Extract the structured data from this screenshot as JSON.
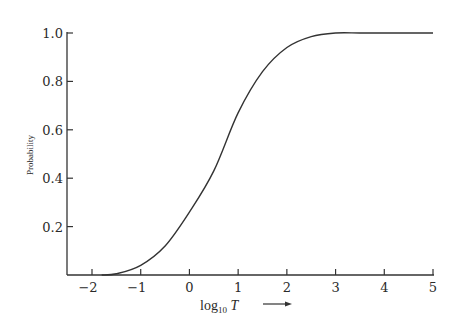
{
  "chart_data": {
    "type": "line",
    "title": "",
    "xlabel": "log10 T →",
    "ylabel": "Probability",
    "xlim": [
      -2.5,
      5
    ],
    "ylim": [
      0,
      1.0
    ],
    "grid": false,
    "legend": null,
    "x_ticks": [
      -2,
      -1,
      0,
      1,
      2,
      3,
      4,
      5
    ],
    "x_tick_labels": [
      "−2",
      "−1",
      "0",
      "1",
      "2",
      "3",
      "4",
      "5"
    ],
    "y_ticks": [
      0.2,
      0.4,
      0.6,
      0.8,
      1.0
    ],
    "y_tick_labels": [
      "0.2",
      "0.4",
      "0.6",
      "0.8",
      "1.0"
    ],
    "series": [
      {
        "name": "cumulative probability",
        "color": "#333333",
        "x": [
          -1.8,
          -1.5,
          -1.0,
          -0.5,
          0.0,
          0.5,
          1.0,
          1.5,
          2.0,
          2.5,
          3.0,
          3.5,
          4.0,
          5.0
        ],
        "y": [
          0.0,
          0.005,
          0.04,
          0.12,
          0.26,
          0.43,
          0.67,
          0.84,
          0.94,
          0.985,
          1.0,
          1.0,
          1.0,
          1.0
        ]
      }
    ]
  },
  "labels": {
    "ylabel": "Probability",
    "xlabel_prefix": "log",
    "xlabel_sub": "10",
    "xlabel_var": " T"
  },
  "colors": {
    "axis": "#333333",
    "curve": "#333333",
    "background": "#ffffff"
  }
}
